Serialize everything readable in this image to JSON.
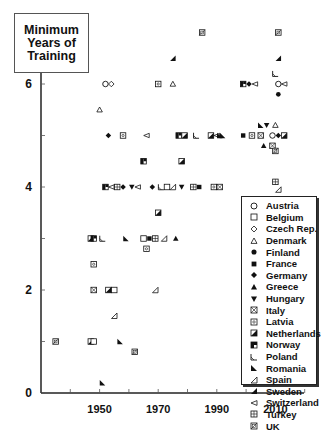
{
  "title_lines": [
    "Minimum",
    "Years of",
    "Training"
  ],
  "chart_data": {
    "type": "scatter",
    "title": "Minimum Years of Training",
    "xlabel": "",
    "ylabel": "Minimum Years of Training",
    "xlim": [
      1930,
      2020
    ],
    "ylim": [
      0,
      7.3
    ],
    "x_ticks": [
      1940,
      1950,
      1960,
      1970,
      1980,
      1990,
      2000,
      2010,
      2020
    ],
    "x_tick_labels": [
      "1950",
      "1970",
      "1990",
      "2010"
    ],
    "x_tick_label_values": [
      1950,
      1970,
      1990,
      2010
    ],
    "y_ticks": [
      0,
      1,
      2,
      3,
      4,
      5,
      6
    ],
    "y_tick_labels": [
      "0",
      "2",
      "4",
      "6"
    ],
    "y_tick_label_values": [
      0,
      2,
      4,
      6
    ],
    "grid": false,
    "legend_position": "lower right",
    "legend": [
      "Austria",
      "Belgium",
      "Czech Rep.",
      "Denmark",
      "Finland",
      "France",
      "Germany",
      "Greece",
      "Hungary",
      "Italy",
      "Latvia",
      "Netherlands",
      "Norway",
      "Poland",
      "Romania",
      "Spain",
      "Sweden",
      "Switzerland",
      "Turkey",
      "UK"
    ],
    "points": [
      {
        "country": "UK",
        "x": 1985,
        "y": 7
      },
      {
        "country": "UK",
        "x": 2011,
        "y": 7
      },
      {
        "country": "Sweden",
        "x": 1975,
        "y": 6.5
      },
      {
        "country": "Sweden",
        "x": 2011,
        "y": 6.5
      },
      {
        "country": "Austria",
        "x": 1952,
        "y": 6
      },
      {
        "country": "Czech Rep.",
        "x": 1954,
        "y": 6
      },
      {
        "country": "Latvia",
        "x": 1970,
        "y": 6
      },
      {
        "country": "Denmark",
        "x": 1975,
        "y": 6
      },
      {
        "country": "Norway",
        "x": 1999,
        "y": 6
      },
      {
        "country": "Germany",
        "x": 2001,
        "y": 6
      },
      {
        "country": "Switzerland",
        "x": 2003,
        "y": 6
      },
      {
        "country": "Poland",
        "x": 2010,
        "y": 6.2
      },
      {
        "country": "Austria",
        "x": 2011,
        "y": 6
      },
      {
        "country": "Switzerland",
        "x": 2013,
        "y": 6
      },
      {
        "country": "Finland",
        "x": 2011,
        "y": 5.8
      },
      {
        "country": "Denmark",
        "x": 1950,
        "y": 5.5
      },
      {
        "country": "Germany",
        "x": 1953,
        "y": 5
      },
      {
        "country": "Latvia",
        "x": 1958,
        "y": 5
      },
      {
        "country": "Switzerland",
        "x": 1966,
        "y": 5
      },
      {
        "country": "Norway",
        "x": 1977,
        "y": 5
      },
      {
        "country": "Netherlands",
        "x": 1979,
        "y": 5
      },
      {
        "country": "Poland",
        "x": 1983,
        "y": 5
      },
      {
        "country": "Netherlands",
        "x": 1988,
        "y": 5
      },
      {
        "country": "Switzerland",
        "x": 1990,
        "y": 5
      },
      {
        "country": "Romania",
        "x": 1991,
        "y": 5
      },
      {
        "country": "Romania",
        "x": 1992,
        "y": 5
      },
      {
        "country": "France",
        "x": 1999,
        "y": 5
      },
      {
        "country": "Latvia",
        "x": 2002,
        "y": 5
      },
      {
        "country": "Italy",
        "x": 2005,
        "y": 5
      },
      {
        "country": "Romania",
        "x": 2005,
        "y": 5.2
      },
      {
        "country": "Hungary",
        "x": 2007,
        "y": 5.2
      },
      {
        "country": "Greece",
        "x": 2006,
        "y": 4.8
      },
      {
        "country": "Denmark",
        "x": 2010,
        "y": 5.2
      },
      {
        "country": "Austria",
        "x": 2009,
        "y": 5
      },
      {
        "country": "Germany",
        "x": 2011,
        "y": 5
      },
      {
        "country": "Netherlands",
        "x": 2013,
        "y": 5
      },
      {
        "country": "Italy",
        "x": 2009,
        "y": 4.8
      },
      {
        "country": "UK",
        "x": 2010,
        "y": 4.7
      },
      {
        "country": "Norway",
        "x": 1965,
        "y": 4.5
      },
      {
        "country": "Netherlands",
        "x": 1978,
        "y": 4.5
      },
      {
        "country": "Norway",
        "x": 1952,
        "y": 4
      },
      {
        "country": "Switzerland",
        "x": 1954,
        "y": 4
      },
      {
        "country": "Turkey",
        "x": 1956,
        "y": 4
      },
      {
        "country": "Germany",
        "x": 1958,
        "y": 4
      },
      {
        "country": "Hungary",
        "x": 1961,
        "y": 4
      },
      {
        "country": "Switzerland",
        "x": 1963,
        "y": 4
      },
      {
        "country": "Germany",
        "x": 1968,
        "y": 4
      },
      {
        "country": "Poland",
        "x": 1971,
        "y": 4
      },
      {
        "country": "Belgium",
        "x": 1973,
        "y": 4
      },
      {
        "country": "Spain",
        "x": 1975,
        "y": 4
      },
      {
        "country": "Hungary",
        "x": 1978,
        "y": 4
      },
      {
        "country": "Turkey",
        "x": 1982,
        "y": 4
      },
      {
        "country": "France",
        "x": 1984,
        "y": 4
      },
      {
        "country": "Latvia",
        "x": 1989,
        "y": 4
      },
      {
        "country": "Italy",
        "x": 1991,
        "y": 4
      },
      {
        "country": "Turkey",
        "x": 2010,
        "y": 4.1
      },
      {
        "country": "Spain",
        "x": 2011,
        "y": 3.95
      },
      {
        "country": "Netherlands",
        "x": 1970,
        "y": 3.5
      },
      {
        "country": "Netherlands",
        "x": 1947,
        "y": 3
      },
      {
        "country": "Norway",
        "x": 1948,
        "y": 3
      },
      {
        "country": "Poland",
        "x": 1951,
        "y": 3
      },
      {
        "country": "Romania",
        "x": 1959,
        "y": 3
      },
      {
        "country": "Belgium",
        "x": 1965,
        "y": 3
      },
      {
        "country": "France",
        "x": 1967,
        "y": 3
      },
      {
        "country": "Turkey",
        "x": 1969,
        "y": 3
      },
      {
        "country": "Spain",
        "x": 1972,
        "y": 3
      },
      {
        "country": "Greece",
        "x": 1976,
        "y": 3
      },
      {
        "country": "Latvia",
        "x": 1966,
        "y": 2.8
      },
      {
        "country": "Latvia",
        "x": 1948,
        "y": 2.5
      },
      {
        "country": "Italy",
        "x": 1948,
        "y": 2
      },
      {
        "country": "Netherlands",
        "x": 1953,
        "y": 2
      },
      {
        "country": "Belgium",
        "x": 1955,
        "y": 2
      },
      {
        "country": "Spain",
        "x": 1969,
        "y": 2
      },
      {
        "country": "Spain",
        "x": 1955,
        "y": 1.5
      },
      {
        "country": "UK",
        "x": 1935,
        "y": 1
      },
      {
        "country": "Netherlands",
        "x": 1947,
        "y": 1
      },
      {
        "country": "Belgium",
        "x": 1948,
        "y": 1
      },
      {
        "country": "Romania",
        "x": 1957,
        "y": 1
      },
      {
        "country": "UK",
        "x": 1962,
        "y": 0.8
      },
      {
        "country": "Romania",
        "x": 1951,
        "y": 0.2
      }
    ]
  },
  "legend_items": [
    {
      "label": "Austria",
      "marker": "circle-open"
    },
    {
      "label": "Belgium",
      "marker": "square-open"
    },
    {
      "label": "Czech Rep.",
      "marker": "diamond-open"
    },
    {
      "label": "Denmark",
      "marker": "triangle-open"
    },
    {
      "label": "Finland",
      "marker": "circle-filled"
    },
    {
      "label": "France",
      "marker": "square-filled"
    },
    {
      "label": "Germany",
      "marker": "diamond-filled"
    },
    {
      "label": "Greece",
      "marker": "triangle-filled"
    },
    {
      "label": "Hungary",
      "marker": "triangle-down-filled"
    },
    {
      "label": "Italy",
      "marker": "square-x"
    },
    {
      "label": "Latvia",
      "marker": "square-dot"
    },
    {
      "label": "Netherlands",
      "marker": "square-half-diag"
    },
    {
      "label": "Norway",
      "marker": "square-half-quarter"
    },
    {
      "label": "Poland",
      "marker": "corner-open"
    },
    {
      "label": "Romania",
      "marker": "corner-filled"
    },
    {
      "label": "Spain",
      "marker": "wedge-open"
    },
    {
      "label": "Sweden",
      "marker": "wedge-filled"
    },
    {
      "label": "Switzerland",
      "marker": "triangle-left-open"
    },
    {
      "label": "Turkey",
      "marker": "square-grid"
    },
    {
      "label": "UK",
      "marker": "square-slash"
    }
  ],
  "colors": {
    "axis": "#222222",
    "marker": "#111111",
    "background": "#ffffff"
  }
}
